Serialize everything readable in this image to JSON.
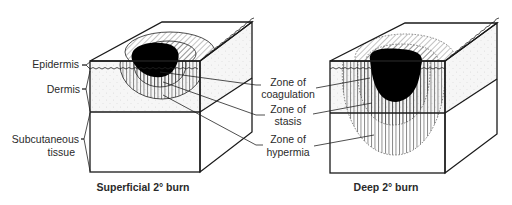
{
  "diagram": {
    "layer_labels": {
      "epidermis": "Epidermis",
      "dermis": "Dermis",
      "subcutaneous_line1": "Subcutaneous",
      "subcutaneous_line2": "tissue"
    },
    "zone_labels": {
      "coagulation_line1": "Zone of",
      "coagulation_line2": "coagulation",
      "stasis_line1": "Zone of",
      "stasis_line2": "stasis",
      "hypermia_line1": "Zone of",
      "hypermia_line2": "hypermia"
    },
    "captions": {
      "left": "Superficial 2° burn",
      "right": "Deep 2° burn"
    },
    "colors": {
      "line": "#1a1a1a",
      "coagulation": "#000000",
      "dermis_fill": "#f4f4f4",
      "background": "#ffffff"
    }
  }
}
